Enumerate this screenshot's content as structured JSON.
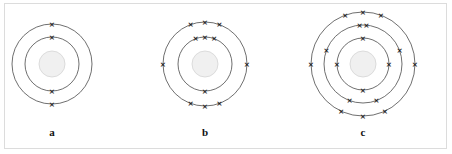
{
  "figure": {
    "background_color": "#ffffff",
    "frame_color": "#dcdcdc",
    "ring_color": "#4a4a4a",
    "nucleus_color": "#f0f0f0",
    "electron_color": "#1a1a1a",
    "electron_symbol": "×"
  },
  "atoms": [
    {
      "id": "a",
      "label": "a",
      "center_x": 52,
      "center_y": 64,
      "nucleus_radius": 13,
      "shells": [
        {
          "radius": 27,
          "electrons": 2,
          "angles": [
            270,
            90
          ]
        },
        {
          "radius": 40,
          "electrons": 2,
          "angles": [
            270,
            90
          ]
        }
      ],
      "total_electrons": 4,
      "shell_count": 2
    },
    {
      "id": "b",
      "label": "b",
      "center_x": 205,
      "center_y": 64,
      "nucleus_radius": 13,
      "shells": [
        {
          "radius": 27,
          "electrons": 4,
          "angles": [
            270,
            90,
            250,
            290
          ]
        },
        {
          "radius": 42,
          "electrons": 8,
          "angles": [
            250,
            290,
            180,
            0,
            110,
            70,
            90,
            270
          ]
        }
      ],
      "total_electrons": 12,
      "shell_count": 2
    },
    {
      "id": "c",
      "label": "c",
      "center_x": 363,
      "center_y": 64,
      "nucleus_radius": 13,
      "shells": [
        {
          "radius": 26,
          "electrons": 4,
          "angles": [
            270,
            90,
            180,
            0
          ]
        },
        {
          "radius": 39,
          "electrons": 6,
          "angles": [
            265,
            275,
            200,
            340,
            110,
            70
          ]
        },
        {
          "radius": 52,
          "electrons": 8,
          "angles": [
            250,
            290,
            270,
            180,
            0,
            115,
            65,
            90
          ]
        }
      ],
      "total_electrons": 18,
      "shell_count": 3
    }
  ],
  "labels": {
    "a": "a",
    "b": "b",
    "c": "c"
  }
}
